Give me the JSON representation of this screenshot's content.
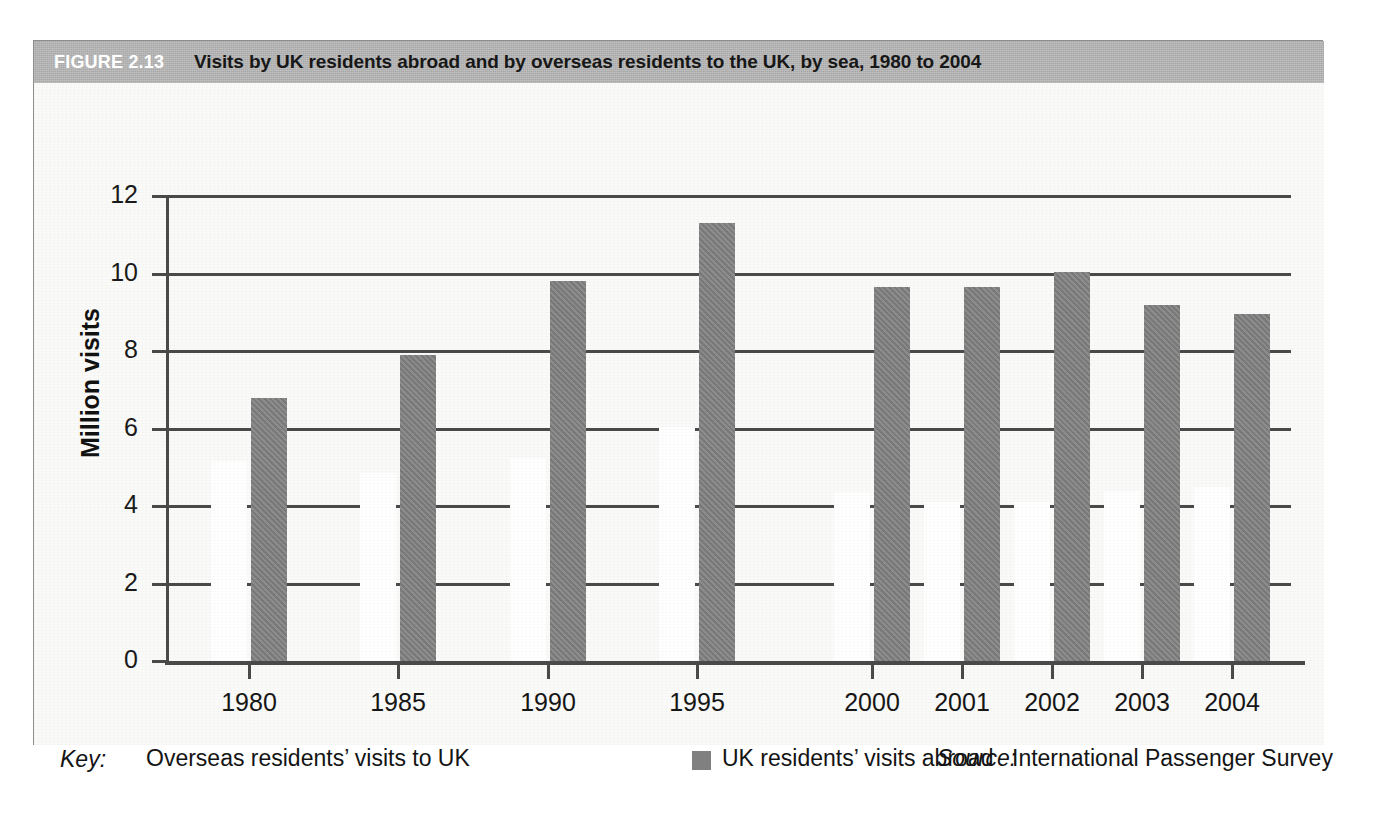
{
  "figure": {
    "number_label": "FIGURE 2.13",
    "title": "Visits by UK residents abroad and by overseas residents to the UK, by sea, 1980 to 2004",
    "banner_color": "#b4b4b4"
  },
  "key": {
    "label": "Key:",
    "entry_white": "Overseas residents’ visits to UK",
    "entry_gray": "UK residents’ visits abroad",
    "white_color": "#ffffff",
    "gray_color": "#808080"
  },
  "source": {
    "label": "Source:",
    "text": "International Passenger Survey"
  },
  "chart_data": {
    "type": "bar",
    "title": "Visits by UK residents abroad and by overseas residents to the UK, by sea, 1980 to 2004",
    "xlabel": "",
    "ylabel": "Million visits",
    "ylim": [
      0,
      12
    ],
    "yticks": [
      0,
      2,
      4,
      6,
      8,
      10,
      12
    ],
    "ytick_labels": [
      "0",
      "2",
      "4",
      "6",
      "8",
      "10",
      "12"
    ],
    "grid": true,
    "legend_position": "below-left",
    "categories": [
      "1980",
      "1985",
      "1990",
      "1995",
      "2000",
      "2001",
      "2002",
      "2003",
      "2004"
    ],
    "series": [
      {
        "name": "Overseas residents’ visits to UK",
        "color": "#ffffff",
        "values": [
          5.15,
          4.85,
          5.25,
          6.05,
          4.35,
          4.1,
          4.1,
          4.4,
          4.5
        ]
      },
      {
        "name": "UK residents’ visits abroad",
        "color": "#808080",
        "values": [
          6.8,
          7.9,
          9.8,
          11.3,
          9.65,
          9.65,
          10.05,
          9.2,
          8.95
        ]
      }
    ]
  }
}
